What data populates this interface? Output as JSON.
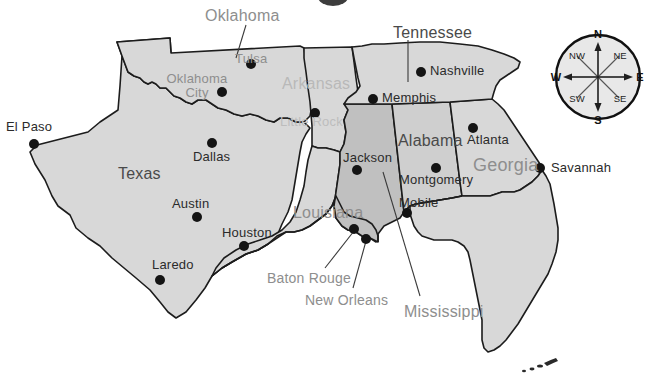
{
  "map": {
    "title": "Southeastern United States",
    "colors": {
      "ocean": "#ffffff",
      "land_light": "#d8d8d8",
      "land_medium": "#cfcfcf",
      "land_dark": "#c0c0c0",
      "border": "#1c1c1c",
      "dot": "#141414",
      "label_gray": "#8e8e8e",
      "label_faint": "#bdbdbd",
      "label_dark": "#4a4a4a"
    },
    "states": [
      {
        "name": "Oklahoma",
        "label_style": "callout",
        "x": 205,
        "y": 8,
        "leader": true
      },
      {
        "name": "Texas",
        "label_style": "dark",
        "x": 118,
        "y": 166,
        "leader": false
      },
      {
        "name": "Arkansas",
        "label_style": "faint",
        "x": 282,
        "y": 76,
        "leader": false
      },
      {
        "name": "Louisiana",
        "label_style": "gray",
        "x": 293,
        "y": 205,
        "leader": false
      },
      {
        "name": "Tennessee",
        "label_style": "callout",
        "x": 393,
        "y": 25,
        "leader": true
      },
      {
        "name": "Mississippi",
        "label_style": "callout",
        "x": 404,
        "y": 304,
        "leader": true
      },
      {
        "name": "Alabama",
        "label_style": "dark",
        "x": 398,
        "y": 133,
        "leader": false
      },
      {
        "name": "Georgia",
        "label_style": "gray",
        "x": 473,
        "y": 156,
        "leader": false
      }
    ],
    "cities": [
      {
        "name": "El Paso",
        "dot_x": 34,
        "dot_y": 144,
        "label_x": 6,
        "label_y": 120,
        "style": "dark"
      },
      {
        "name": "Dallas",
        "dot_x": 212,
        "dot_y": 143,
        "label_x": 193,
        "label_y": 150,
        "style": "dark"
      },
      {
        "name": "Austin",
        "dot_x": 197,
        "dot_y": 217,
        "label_x": 172,
        "label_y": 197,
        "style": "dark"
      },
      {
        "name": "Houston",
        "dot_x": 244,
        "dot_y": 246,
        "label_x": 222,
        "label_y": 226,
        "style": "dark"
      },
      {
        "name": "Laredo",
        "dot_x": 160,
        "dot_y": 280,
        "label_x": 152,
        "label_y": 258,
        "style": "dark"
      },
      {
        "name": "Oklahoma City",
        "dot_x": 222,
        "dot_y": 92,
        "label_x": 166,
        "label_y": 72,
        "style": "gray",
        "two_line": true
      },
      {
        "name": "Tulsa",
        "dot_x": 251,
        "dot_y": 64,
        "label_x": 235,
        "label_y": 52,
        "style": "gray"
      },
      {
        "name": "Little Rock",
        "dot_x": 315,
        "dot_y": 113,
        "label_x": 280,
        "label_y": 115,
        "style": "faint"
      },
      {
        "name": "Nashville",
        "dot_x": 421,
        "dot_y": 72,
        "label_x": 430,
        "label_y": 64,
        "style": "dark"
      },
      {
        "name": "Memphis",
        "dot_x": 373,
        "dot_y": 99,
        "label_x": 382,
        "label_y": 91,
        "style": "dark"
      },
      {
        "name": "Jackson",
        "dot_x": 357,
        "dot_y": 170,
        "label_x": 343,
        "label_y": 151,
        "style": "dark"
      },
      {
        "name": "Montgomery",
        "dot_x": 436,
        "dot_y": 168,
        "label_x": 399,
        "label_y": 173,
        "style": "dark"
      },
      {
        "name": "Mobile",
        "dot_x": 407,
        "dot_y": 213,
        "label_x": 399,
        "label_y": 196,
        "style": "dark"
      },
      {
        "name": "Atlanta",
        "dot_x": 473,
        "dot_y": 128,
        "label_x": 467,
        "label_y": 133,
        "style": "dark"
      },
      {
        "name": "Savannah",
        "dot_x": 540,
        "dot_y": 168,
        "label_x": 551,
        "label_y": 161,
        "style": "dark"
      },
      {
        "name": "Baton Rouge",
        "dot_x": 354,
        "dot_y": 229,
        "label_x": 267,
        "label_y": 271,
        "style": "gray"
      },
      {
        "name": "New Orleans",
        "dot_x": 366,
        "dot_y": 239,
        "label_x": 305,
        "label_y": 293,
        "style": "gray"
      }
    ],
    "compass": {
      "center_x": 598,
      "center_y": 77,
      "radius": 42,
      "directions": {
        "n": "N",
        "s": "S",
        "e": "E",
        "w": "W",
        "ne": "NE",
        "nw": "NW",
        "se": "SE",
        "sw": "SW"
      }
    }
  }
}
